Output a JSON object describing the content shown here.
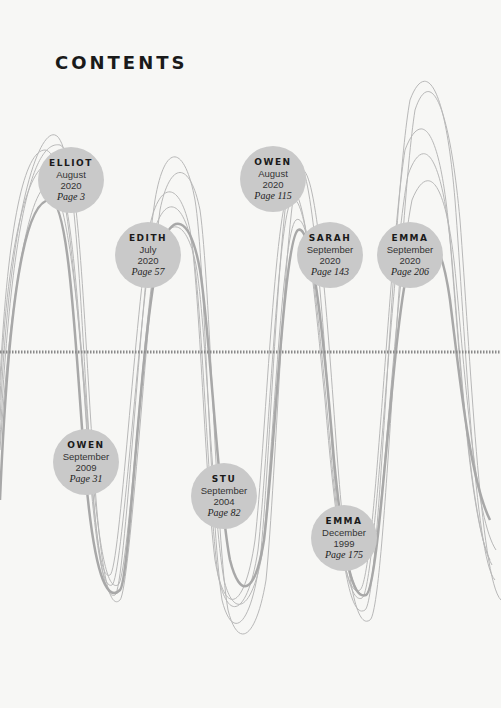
{
  "title": "CONTENTS",
  "entries": [
    {
      "name": "ELLIOT",
      "month": "August",
      "year": "2020",
      "page": "Page 3",
      "cx": 71,
      "cy": 180
    },
    {
      "name": "EDITH",
      "month": "July",
      "year": "2020",
      "page": "Page 57",
      "cx": 148,
      "cy": 255
    },
    {
      "name": "OWEN",
      "month": "August",
      "year": "2020",
      "page": "Page 115",
      "cx": 273,
      "cy": 179
    },
    {
      "name": "SARAH",
      "month": "September",
      "year": "2020",
      "page": "Page 143",
      "cx": 330,
      "cy": 255
    },
    {
      "name": "EMMA",
      "month": "September",
      "year": "2020",
      "page": "Page 206",
      "cx": 410,
      "cy": 255
    },
    {
      "name": "OWEN",
      "month": "September",
      "year": "2009",
      "page": "Page 31",
      "cx": 86,
      "cy": 462
    },
    {
      "name": "STU",
      "month": "September",
      "year": "2004",
      "page": "Page 82",
      "cx": 224,
      "cy": 496
    },
    {
      "name": "EMMA",
      "month": "December",
      "year": "1999",
      "page": "Page 175",
      "cx": 345,
      "cy": 559
    }
  ],
  "colors": {
    "circle": "#c9c9c9",
    "line": "#b5b5b5",
    "axis": "#8a8a8a"
  }
}
